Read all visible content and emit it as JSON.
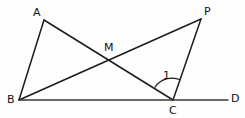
{
  "figure": {
    "type": "geometry-diagram",
    "width": 245,
    "height": 118,
    "background_color": "#fefefe",
    "stroke_color": "#1c1c1c",
    "label_color": "#111111",
    "points": [
      {
        "id": "A",
        "label": "A",
        "x": 44,
        "y": 20,
        "label_x": 33,
        "label_y": 7
      },
      {
        "id": "B",
        "label": "B",
        "x": 19,
        "y": 100,
        "label_x": 7,
        "label_y": 94
      },
      {
        "id": "C",
        "label": "C",
        "x": 173,
        "y": 100,
        "label_x": 169,
        "label_y": 105
      },
      {
        "id": "D",
        "label": "D",
        "x": 228,
        "y": 100,
        "label_x": 231,
        "label_y": 93
      },
      {
        "id": "P",
        "label": "P",
        "x": 201,
        "y": 19,
        "label_x": 204,
        "label_y": 6
      },
      {
        "id": "M",
        "label": "M",
        "x": 110,
        "y": 58,
        "label_x": 104,
        "label_y": 42
      }
    ],
    "segments": [
      {
        "id": "AB",
        "from": "A",
        "to": "B",
        "name": "segment-ab"
      },
      {
        "id": "AC",
        "from": "A",
        "to": "C",
        "name": "segment-ac"
      },
      {
        "id": "BP",
        "from": "B",
        "to": "P",
        "name": "segment-bp"
      },
      {
        "id": "PC",
        "from": "P",
        "to": "C",
        "name": "segment-pc"
      },
      {
        "id": "BD",
        "from": "B",
        "to": "D",
        "name": "segment-bd"
      }
    ],
    "angles": [
      {
        "id": "angle1",
        "label": "1",
        "vertex": "C",
        "from_ray": "CA",
        "to_ray": "CP",
        "radius": 21,
        "label_x": 163,
        "label_y": 70
      }
    ]
  }
}
